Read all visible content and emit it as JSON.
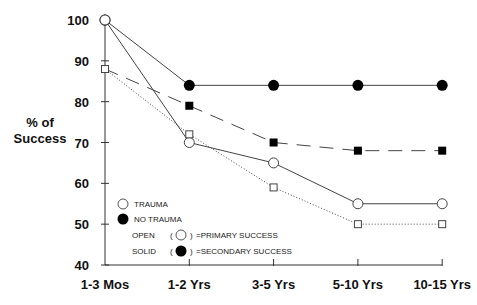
{
  "chart_data": {
    "type": "line",
    "title": "",
    "xlabel": "",
    "ylabel": "% of Success",
    "ylabel_lines": [
      "% of",
      "Success"
    ],
    "ylim": [
      40,
      100
    ],
    "yticks": [
      40,
      50,
      60,
      70,
      80,
      90,
      100
    ],
    "categories": [
      "1-3 Mos",
      "1-2 Yrs",
      "3-5 Yrs",
      "5-10 Yrs",
      "10-15 Yrs"
    ],
    "grid": false,
    "series": [
      {
        "name": "No Trauma - Secondary Success",
        "marker": "filled-circle",
        "line": "solid",
        "values": [
          100,
          84,
          84,
          84,
          84
        ]
      },
      {
        "name": "Trauma - Primary Success",
        "marker": "open-circle",
        "line": "solid",
        "values": [
          100,
          70,
          65,
          55,
          55
        ]
      },
      {
        "name": "No Trauma - Primary Success (square, solid)",
        "marker": "filled-square",
        "line": "dashed",
        "values": [
          88,
          79,
          70,
          68,
          68
        ]
      },
      {
        "name": "Trauma (square, open)",
        "marker": "open-square",
        "line": "dotted",
        "values": [
          88,
          72,
          59,
          50,
          50
        ]
      }
    ],
    "legend": {
      "position": "lower-left",
      "entries": [
        {
          "symbol": "open-circle",
          "text": "TRAUMA"
        },
        {
          "symbol": "filled-circle",
          "text": "NO TRAUMA"
        },
        {
          "prefix": "OPEN",
          "symbol": "open-circle",
          "text": "=PRIMARY SUCCESS"
        },
        {
          "prefix": "SOLID",
          "symbol": "filled-circle",
          "text": "=SECONDARY SUCCESS"
        }
      ]
    }
  }
}
